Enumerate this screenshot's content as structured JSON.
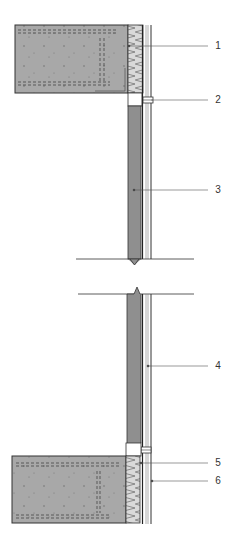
{
  "diagram": {
    "type": "construction-wall-section",
    "colors": {
      "concrete": "#a9a9a9",
      "wall": "#8f8f8f",
      "insulation": "#d4d4d4",
      "line": "#333333",
      "background": "#ffffff"
    },
    "callouts": [
      {
        "id": "1",
        "label": "1",
        "y": 46
      },
      {
        "id": "2",
        "label": "2",
        "y": 100
      },
      {
        "id": "3",
        "label": "3",
        "y": 190
      },
      {
        "id": "4",
        "label": "4",
        "y": 366
      },
      {
        "id": "5",
        "label": "5",
        "y": 463
      },
      {
        "id": "6",
        "label": "6",
        "y": 481
      }
    ]
  }
}
